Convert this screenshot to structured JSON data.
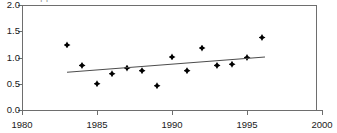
{
  "artifact": {
    "top_cut_text": "clipped text row"
  },
  "chart_data": {
    "type": "scatter",
    "title": "",
    "subtitle": "",
    "xlabel": "",
    "ylabel": "",
    "xlim": [
      1980,
      2000
    ],
    "ylim": [
      0.0,
      2.0
    ],
    "grid": false,
    "legend": "none",
    "x_ticks": [
      1980,
      1985,
      1990,
      1995,
      2000
    ],
    "x_tick_labels": [
      "1980",
      "1985",
      "1990",
      "1995",
      "2000"
    ],
    "y_ticks": [
      0.0,
      0.5,
      1.0,
      1.5,
      2.0
    ],
    "y_tick_labels": [
      "0.0",
      "0.5",
      "1.0",
      "1.5",
      "2.0"
    ],
    "marker": "diamond",
    "marker_color": "#000000",
    "line_color": "#4d4d4d",
    "x": [
      1983,
      1984,
      1985,
      1986,
      1987,
      1988,
      1989,
      1990,
      1991,
      1992,
      1993,
      1994,
      1995,
      1996
    ],
    "y": [
      1.24,
      0.85,
      0.5,
      0.69,
      0.8,
      0.75,
      0.46,
      1.01,
      0.75,
      1.18,
      0.85,
      0.87,
      1.0,
      1.38
    ],
    "points": [
      {
        "x": 1983,
        "y": 1.24
      },
      {
        "x": 1984,
        "y": 0.85
      },
      {
        "x": 1985,
        "y": 0.5
      },
      {
        "x": 1986,
        "y": 0.69
      },
      {
        "x": 1987,
        "y": 0.8
      },
      {
        "x": 1988,
        "y": 0.75
      },
      {
        "x": 1989,
        "y": 0.46
      },
      {
        "x": 1990,
        "y": 1.01
      },
      {
        "x": 1991,
        "y": 0.75
      },
      {
        "x": 1992,
        "y": 1.18
      },
      {
        "x": 1993,
        "y": 0.85
      },
      {
        "x": 1994,
        "y": 0.87
      },
      {
        "x": 1995,
        "y": 1.0
      },
      {
        "x": 1996,
        "y": 1.38
      }
    ],
    "series": [
      {
        "name": "data points",
        "type": "scatter",
        "values": [
          1.24,
          0.85,
          0.5,
          0.69,
          0.8,
          0.75,
          0.46,
          1.01,
          0.75,
          1.18,
          0.85,
          0.87,
          1.0,
          1.38
        ]
      },
      {
        "name": "trend line",
        "type": "line",
        "x": [
          1983.0,
          1996.2
        ],
        "values": [
          0.72,
          1.01
        ]
      }
    ]
  }
}
